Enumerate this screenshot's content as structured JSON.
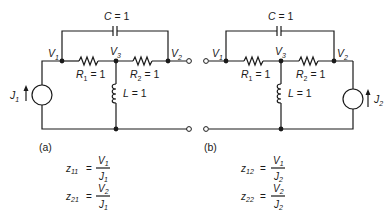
{
  "diagram": {
    "type": "two-port circuit",
    "panels": [
      {
        "id": "a",
        "caption": "(a)",
        "components": {
          "capacitor": {
            "name": "C",
            "value": "1",
            "label": "C = 1"
          },
          "r1": {
            "name": "R1",
            "value": "1"
          },
          "r2": {
            "name": "R2",
            "value": "1"
          },
          "inductor": {
            "name": "L",
            "value": "1",
            "label": "L = 1"
          },
          "source": {
            "name": "J",
            "sub": "1",
            "port": "input"
          }
        },
        "nodes": [
          {
            "name": "V",
            "sub": "1"
          },
          {
            "name": "V",
            "sub": "3"
          },
          {
            "name": "V",
            "sub": "2"
          }
        ],
        "equations": [
          {
            "lhs": "z",
            "lhs_sub": "11",
            "num": "V",
            "num_sub": "1",
            "den": "J",
            "den_sub": "1"
          },
          {
            "lhs": "z",
            "lhs_sub": "21",
            "num": "V",
            "num_sub": "2",
            "den": "J",
            "den_sub": "1"
          }
        ]
      },
      {
        "id": "b",
        "caption": "(b)",
        "components": {
          "capacitor": {
            "name": "C",
            "value": "1",
            "label": "C = 1"
          },
          "r1": {
            "name": "R1",
            "value": "1"
          },
          "r2": {
            "name": "R2",
            "value": "1"
          },
          "inductor": {
            "name": "L",
            "value": "1",
            "label": "L = 1"
          },
          "source": {
            "name": "J",
            "sub": "2",
            "port": "output"
          }
        },
        "nodes": [
          {
            "name": "V",
            "sub": "1"
          },
          {
            "name": "V",
            "sub": "3"
          },
          {
            "name": "V",
            "sub": "2"
          }
        ],
        "equations": [
          {
            "lhs": "z",
            "lhs_sub": "12",
            "num": "V",
            "num_sub": "1",
            "den": "J",
            "den_sub": "2"
          },
          {
            "lhs": "z",
            "lhs_sub": "22",
            "num": "V",
            "num_sub": "2",
            "den": "J",
            "den_sub": "2"
          }
        ]
      }
    ],
    "labels": {
      "eq_sign": "=",
      "value_eq": " = ",
      "r_name": "R",
      "one": "1"
    }
  }
}
